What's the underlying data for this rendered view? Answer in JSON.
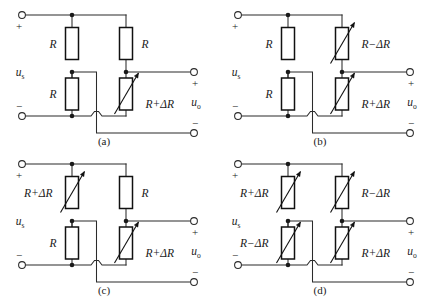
{
  "figure": {
    "type": "circuit-diagram",
    "panel_count": 4,
    "colors": {
      "background": "#ffffff",
      "wire": "#2b2b2b",
      "resistor_outline": "#111111",
      "text": "#1a1a1a"
    }
  },
  "common": {
    "source_label": "u",
    "source_subscript": "s",
    "output_label": "u",
    "output_subscript": "o",
    "plus_sign": "+",
    "minus_sign": "−",
    "resistor_plain": "R",
    "resistor_plus": "R+ΔR",
    "resistor_minus": "R−ΔR"
  },
  "panels": [
    {
      "id": "a",
      "caption": "(a)",
      "active_arm_count": 1,
      "arms": {
        "top_left": {
          "label": "R",
          "variable": false,
          "label_side": "left"
        },
        "bottom_left": {
          "label": "R",
          "variable": false,
          "label_side": "left"
        },
        "top_right": {
          "label": "R",
          "variable": false,
          "label_side": "right"
        },
        "bottom_right": {
          "label": "R+ΔR",
          "variable": true,
          "label_side": "right"
        }
      }
    },
    {
      "id": "b",
      "caption": "(b)",
      "active_arm_count": 2,
      "arms": {
        "top_left": {
          "label": "R",
          "variable": false,
          "label_side": "left"
        },
        "bottom_left": {
          "label": "R",
          "variable": false,
          "label_side": "left"
        },
        "top_right": {
          "label": "R−ΔR",
          "variable": true,
          "label_side": "right"
        },
        "bottom_right": {
          "label": "R+ΔR",
          "variable": true,
          "label_side": "right"
        }
      }
    },
    {
      "id": "c",
      "caption": "(c)",
      "active_arm_count": 2,
      "arms": {
        "top_left": {
          "label": "R+ΔR",
          "variable": true,
          "label_side": "left"
        },
        "bottom_left": {
          "label": "R",
          "variable": false,
          "label_side": "left"
        },
        "top_right": {
          "label": "R",
          "variable": false,
          "label_side": "right"
        },
        "bottom_right": {
          "label": "R+ΔR",
          "variable": true,
          "label_side": "right"
        }
      }
    },
    {
      "id": "d",
      "caption": "(d)",
      "active_arm_count": 4,
      "arms": {
        "top_left": {
          "label": "R+ΔR",
          "variable": true,
          "label_side": "left"
        },
        "bottom_left": {
          "label": "R−ΔR",
          "variable": true,
          "label_side": "left"
        },
        "top_right": {
          "label": "R−ΔR",
          "variable": true,
          "label_side": "right"
        },
        "bottom_right": {
          "label": "R+ΔR",
          "variable": true,
          "label_side": "right"
        }
      }
    }
  ]
}
